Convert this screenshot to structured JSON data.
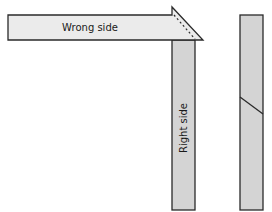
{
  "diagram": {
    "colors": {
      "wrong_side_fill": "#ebebeb",
      "right_side_fill": "#d4d4d4",
      "stroke": "#2a2a2a"
    },
    "horizontal_strip": {
      "label": "Wrong side"
    },
    "vertical_strip": {
      "label": "Right side"
    },
    "second_strip": {
      "label": ""
    }
  }
}
